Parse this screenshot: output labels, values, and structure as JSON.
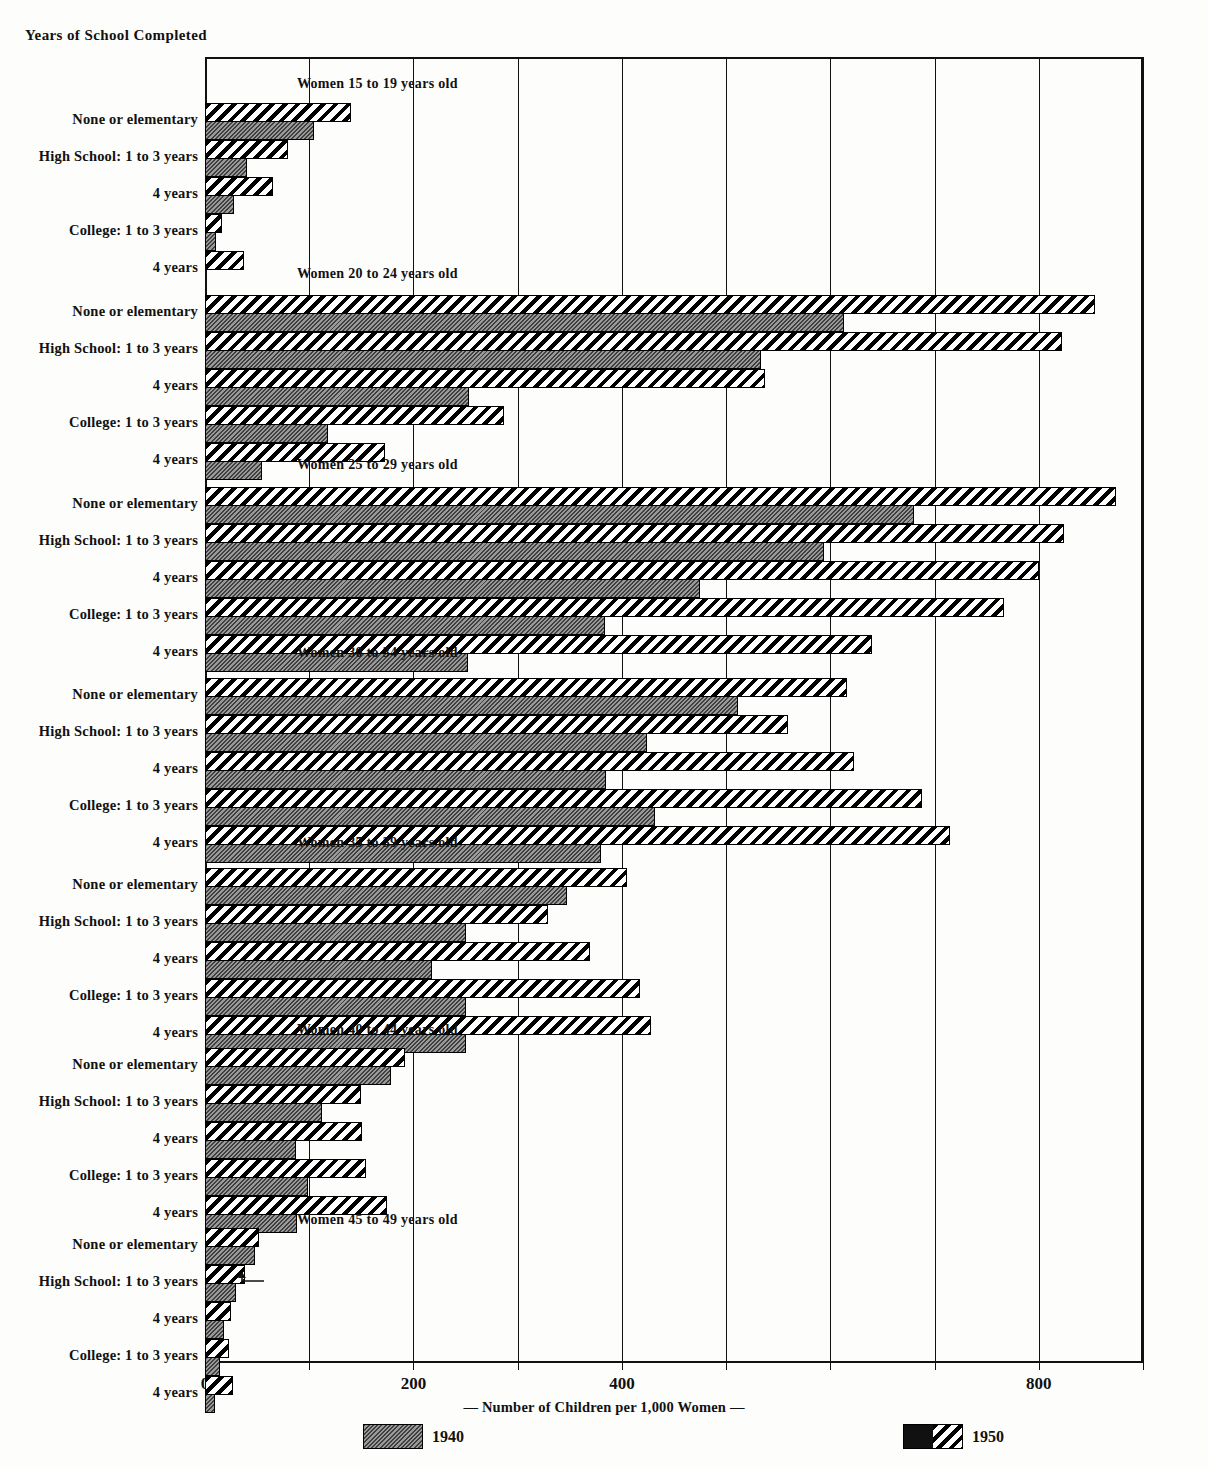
{
  "header": {
    "title": "Years of School Completed"
  },
  "axis": {
    "caption": "—  Number of Children per 1,000 Women  —",
    "ticks": [
      {
        "value": 0,
        "label": "0"
      },
      {
        "value": 100,
        "label": ""
      },
      {
        "value": 200,
        "label": "200"
      },
      {
        "value": 300,
        "label": ""
      },
      {
        "value": 400,
        "label": "400"
      },
      {
        "value": 500,
        "label": ""
      },
      {
        "value": 600,
        "label": ""
      },
      {
        "value": 700,
        "label": ""
      },
      {
        "value": 800,
        "label": "800"
      },
      {
        "value": 900,
        "label": ""
      }
    ],
    "min": 0,
    "max": 900
  },
  "legend": [
    {
      "key": "y1940",
      "label": "1940"
    },
    {
      "key": "y1950",
      "label": "1950"
    }
  ],
  "colors": {
    "bar_1940": "#6d6d6d",
    "bar_1950": "#ffffff",
    "outline": "#000000",
    "background": "#fdfdfb"
  },
  "chart_data": {
    "type": "bar",
    "orientation": "horizontal",
    "title": "Years of School Completed",
    "xlabel": "—  Number of Children per 1,000 Women  —",
    "ylabel": "",
    "xlim": [
      0,
      900
    ],
    "grid": true,
    "legend_position": "bottom",
    "categories": [
      "None or elementary",
      "High School: 1 to 3 years",
      "4 years",
      "College: 1 to 3 years",
      "4 years"
    ],
    "groups": [
      {
        "name": "Women 15 to 19 years old",
        "series": [
          {
            "name": "1940",
            "values": [
              105,
              40,
              28,
              11,
              0
            ]
          },
          {
            "name": "1950",
            "values": [
              140,
              80,
              65,
              16,
              37
            ]
          }
        ]
      },
      {
        "name": "Women 20 to 24 years old",
        "series": [
          {
            "name": "1940",
            "values": [
              613,
              533,
              253,
              118,
              55
            ]
          },
          {
            "name": "1950",
            "values": [
              854,
              822,
              537,
              287,
              173
            ]
          }
        ]
      },
      {
        "name": "Women 25 to 29 years old",
        "series": [
          {
            "name": "1940",
            "values": [
              680,
              594,
              475,
              384,
              252
            ]
          },
          {
            "name": "1950",
            "values": [
              874,
              824,
              800,
              767,
              640
            ]
          }
        ]
      },
      {
        "name": "Women 30 to 34 years old",
        "series": [
          {
            "name": "1940",
            "values": [
              511,
              424,
              385,
              432,
              380
            ]
          },
          {
            "name": "1950",
            "values": [
              616,
              559,
              623,
              688,
              715
            ]
          }
        ]
      },
      {
        "name": "Women 35 to 39 years old",
        "series": [
          {
            "name": "1940",
            "values": [
              347,
              250,
              218,
              250,
              250
            ]
          },
          {
            "name": "1950",
            "values": [
              405,
              329,
              369,
              417,
              428
            ]
          }
        ]
      },
      {
        "name": "Women 40 to 44 years old",
        "series": [
          {
            "name": "1940",
            "values": [
              178,
              112,
              87,
              99,
              88
            ]
          },
          {
            "name": "1950",
            "values": [
              192,
              150,
              151,
              154,
              175
            ]
          }
        ]
      },
      {
        "name": "Women 45 to 49 years old",
        "series": [
          {
            "name": "1940",
            "values": [
              48,
              30,
              18,
              14,
              10
            ]
          },
          {
            "name": "1950",
            "values": [
              52,
              38,
              25,
              23,
              27
            ]
          }
        ]
      }
    ]
  }
}
